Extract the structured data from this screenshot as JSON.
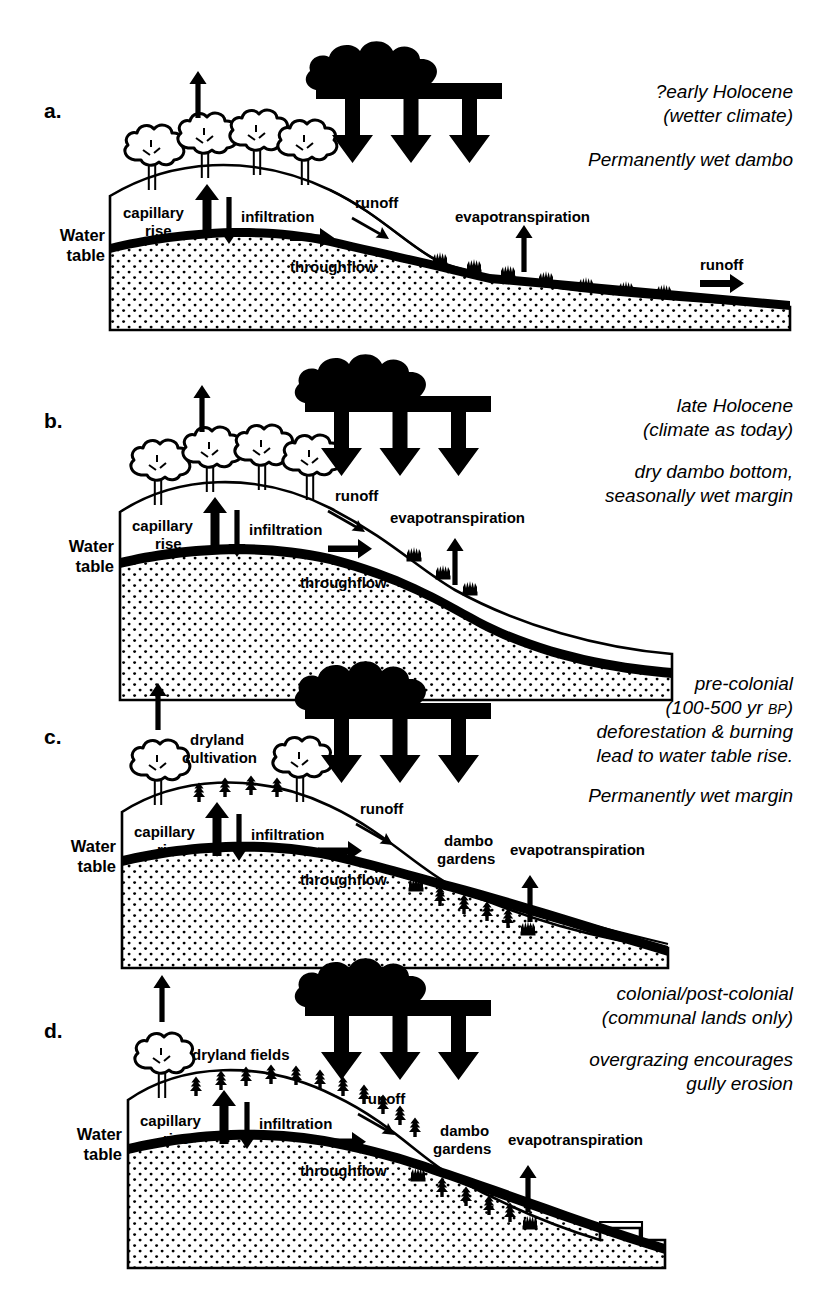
{
  "figure": {
    "background_color": "#ffffff",
    "ink_color": "#000000"
  },
  "panels": [
    {
      "letter": "a.",
      "caption_lines": [
        "?early Holocene",
        "(wetter climate)"
      ],
      "caption_lines2": [
        "Permanently wet dambo"
      ],
      "labels": {
        "water_table": "Water\ntable",
        "water_table_l1": "Water",
        "water_table_l2": "table",
        "capillary_l1": "capillary",
        "capillary_l2": "rise",
        "infiltration": "infiltration",
        "runoff": "runoff",
        "runoff2": "runoff",
        "throughflow": "throughflow",
        "evapotranspiration": "evapotranspiration"
      },
      "features": {
        "trees": 4,
        "crops": 0,
        "grass_tufts": 7,
        "rain_arrows": 3,
        "gully": false,
        "dambo_gardens": false
      }
    },
    {
      "letter": "b.",
      "caption_lines": [
        "late Holocene",
        "(climate as today)"
      ],
      "caption_lines2": [
        "dry dambo bottom,",
        "seasonally wet margin"
      ],
      "labels": {
        "water_table_l1": "Water",
        "water_table_l2": "table",
        "capillary_l1": "capillary",
        "capillary_l2": "rise",
        "infiltration": "infiltration",
        "runoff": "runoff",
        "throughflow": "throughflow",
        "evapotranspiration": "evapotranspiration"
      },
      "features": {
        "trees": 4,
        "crops": 0,
        "grass_tufts": 3,
        "rain_arrows": 3,
        "gully": false,
        "dambo_gardens": false
      }
    },
    {
      "letter": "c.",
      "caption_lines": [
        "pre-colonial",
        "(100-500 yr BP)",
        "deforestation & burning",
        "lead to water table rise."
      ],
      "caption_lines2": [
        "Permanently wet margin"
      ],
      "caption_bp_prefix": "(100-500 yr ",
      "caption_bp": "BP",
      "caption_bp_suffix": ")",
      "labels": {
        "water_table_l1": "Water",
        "water_table_l2": "table",
        "capillary_l1": "capillary",
        "capillary_l2": "rise",
        "infiltration": "infiltration",
        "runoff": "runoff",
        "throughflow": "throughflow",
        "evapotranspiration": "evapotranspiration",
        "dryland_l1": "dryland",
        "dryland_l2": "cultivation",
        "gardens_l1": "dambo",
        "gardens_l2": "gardens"
      },
      "features": {
        "trees": 2,
        "crops": 4,
        "grass_tufts": 2,
        "garden_crops": 6,
        "rain_arrows": 3,
        "gully": false,
        "dambo_gardens": true
      }
    },
    {
      "letter": "d.",
      "caption_lines": [
        "colonial/post-colonial",
        "(communal lands only)"
      ],
      "caption_lines2": [
        "overgrazing encourages",
        "gully erosion"
      ],
      "labels": {
        "water_table_l1": "Water",
        "water_table_l2": "table",
        "capillary_l1": "capillary",
        "capillary_l2": "rise",
        "infiltration": "infiltration",
        "runoff": "runoff",
        "throughflow": "throughflow",
        "evapotranspiration": "evapotranspiration",
        "dryland_fields": "dryland fields",
        "gardens_l1": "dambo",
        "gardens_l2": "gardens"
      },
      "features": {
        "trees": 1,
        "crops": 11,
        "grass_tufts": 1,
        "garden_crops": 6,
        "rain_arrows": 3,
        "gully": true,
        "dambo_gardens": true
      }
    }
  ]
}
